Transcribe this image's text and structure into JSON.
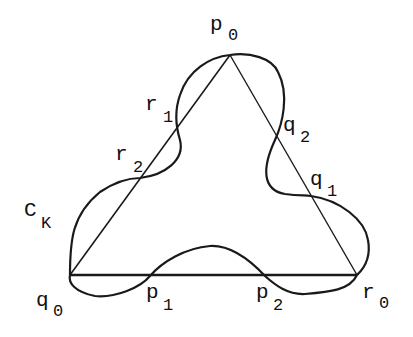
{
  "diagram": {
    "curve_label": {
      "base": "C",
      "sub": "K"
    },
    "vertices": [
      {
        "base": "p",
        "sub": "0"
      },
      {
        "base": "q",
        "sub": "0"
      },
      {
        "base": "r",
        "sub": "0"
      }
    ],
    "intersections": {
      "left_side": [
        {
          "base": "r",
          "sub": "1"
        },
        {
          "base": "r",
          "sub": "2"
        }
      ],
      "right_side": [
        {
          "base": "q",
          "sub": "2"
        },
        {
          "base": "q",
          "sub": "1"
        }
      ],
      "bottom_side": [
        {
          "base": "p",
          "sub": "1"
        },
        {
          "base": "p",
          "sub": "2"
        }
      ]
    },
    "colors": {
      "stroke": "#1a1a1a",
      "background": "#ffffff"
    }
  }
}
